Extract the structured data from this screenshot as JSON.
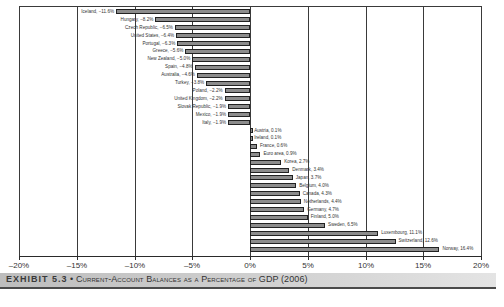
{
  "chart_data": {
    "type": "bar",
    "orientation": "horizontal",
    "title": "Current-Account Balances as a Percentage of GDP (2006)",
    "exhibit": "EXHIBIT 5.3",
    "xlabel": "",
    "ylabel": "",
    "xlim": [
      -20,
      20
    ],
    "x_ticks": [
      "-20%",
      "-15%",
      "-10%",
      "-5%",
      "0%",
      "5%",
      "10%",
      "15%",
      "20%"
    ],
    "grid": true,
    "legend": null,
    "categories": [
      "Iceland",
      "Hungary",
      "Czech Republic",
      "United States",
      "Portugal",
      "Greece",
      "New Zealand",
      "Spain",
      "Australia",
      "Turkey",
      "Poland",
      "United Kingdom",
      "Slovak Republic",
      "Mexico",
      "Italy",
      "Austria",
      "Ireland",
      "France",
      "Euro area",
      "Korea",
      "Denmark",
      "Japan",
      "Belgium",
      "Canada",
      "Netherlands",
      "Germany",
      "Finland",
      "Sweden",
      "Luxembourg",
      "Switzerland",
      "Norway"
    ],
    "values": [
      -11.6,
      -8.2,
      -6.5,
      -6.4,
      -6.3,
      -5.6,
      -5.0,
      -4.8,
      -4.6,
      -3.8,
      -2.2,
      -2.2,
      -1.9,
      -1.9,
      -1.9,
      0.1,
      0.1,
      0.6,
      0.9,
      2.7,
      3.4,
      3.7,
      4.0,
      4.3,
      4.4,
      4.7,
      5.0,
      6.5,
      11.1,
      12.6,
      16.4
    ],
    "labels": [
      "Iceland, −11.6%",
      "Hungary, −8.2%",
      "Czech Republic, −6.5%",
      "United States, −6.4%",
      "Portugal, −6.3%",
      "Greece, −5.6%",
      "New Zealand, −5.0%",
      "Spain, −4.8%",
      "Australia, −4.6%",
      "Turkey, −3.8%",
      "Poland, −2.2%",
      "United Kingdom, −2.2%",
      "Slovak Republic, −1.9%",
      "Mexico, −1.9%",
      "Italy, −1.9%",
      "Austria, 0.1%",
      "Ireland, 0.1%",
      "France, 0.6%",
      "Euro area, 0.9%",
      "Korea, 2.7%",
      "Denmark, 3.4%",
      "Japan, 3.7%",
      "Belgium, 4.0%",
      "Canada, 4.3%",
      "Netherlands, 4.4%",
      "Germany, 4.7%",
      "Finland, 5.0%",
      "Sweden, 6.5%",
      "Luxembourg, 11.1%",
      "Switzerland, 12.6%",
      "Norway, 16.4%"
    ],
    "colors": {
      "bar_fill": "#8c8c8c",
      "bar_edge": "#222222",
      "grid": "#3a3a3a"
    }
  },
  "caption": {
    "prefix": "EXHIBIT 5.3",
    "separator": " • ",
    "text": "Current-Account Balances as a Percentage of GDP (2006)"
  }
}
